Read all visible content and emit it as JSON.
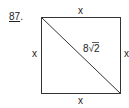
{
  "problem": {
    "number": "87",
    "suffix": "."
  },
  "diagram": {
    "shape": "square",
    "side_labels": {
      "top": "x",
      "bottom": "x",
      "left": "x",
      "right": "x"
    },
    "diagonal_label": "8√2",
    "diagonal_label_parts": {
      "coefficient": "8",
      "radical": "√",
      "radicand": "2"
    }
  }
}
